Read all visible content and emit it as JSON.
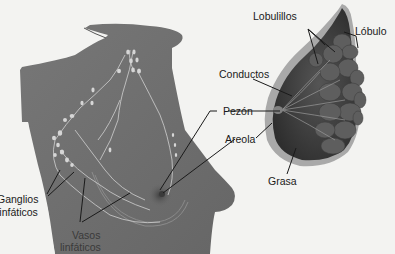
{
  "figure": {
    "type": "anatomical-diagram",
    "colors": {
      "background": "#f3f3f1",
      "body": "#6e6e6e",
      "body_dark": "#5a5a5a",
      "gland": "#4a4a4a",
      "gland_light": "#7a7a7a",
      "fat_rim": "#a8a8a8",
      "lymph": "#d8d8d8",
      "leader_line": "#1a1a1a",
      "text": "#1a1a1a"
    }
  },
  "labels": {
    "lobulillos": "Lobulillos",
    "lobulo": "Lóbulo",
    "conductos": "Conductos",
    "pezon": "Pezón",
    "areola": "Areola",
    "grasa": "Grasa",
    "ganglios_line1": "Ganglios",
    "ganglios_line2": "linfáticos",
    "vasos_line1": "Vasos",
    "vasos_line2": "linfáticos"
  }
}
